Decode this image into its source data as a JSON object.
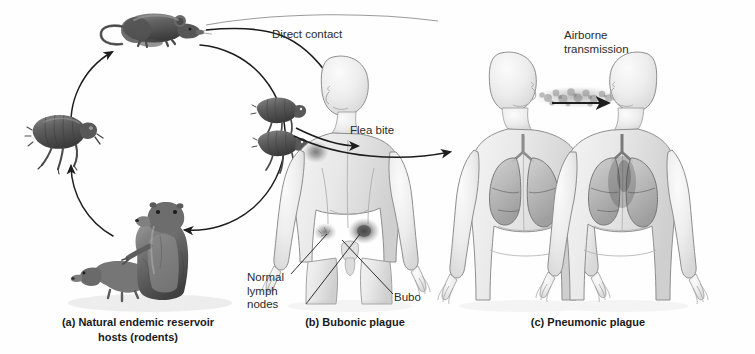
{
  "figure": {
    "background_color": "#fefefe",
    "ink_color": "#242424"
  },
  "path_labels": {
    "direct_contact": "Direct contact",
    "flea_bite": "Flea bite",
    "airborne": "Airborne\ntransmission"
  },
  "callouts": {
    "lymph_nodes": "Normal\nlymph\nnodes",
    "bubo": "Bubo"
  },
  "captions": {
    "a": "(a) Natural endemic reservoir\nhosts (rodents)",
    "b": "(b) Bubonic plague",
    "c": "(c) Pneumonic plague"
  },
  "organisms": {
    "rat": "rat-illustration",
    "flea_vector": "flea-illustration",
    "rodents": "prairie-dog-illustration",
    "fleas_on_human": "fleas-biting-illustration"
  },
  "human_figures": {
    "bubonic": "human-figure-bubonic",
    "pneumonic_source": "human-figure-pneumonic-source",
    "pneumonic_recipient": "human-figure-pneumonic-recipient"
  },
  "anatomy": {
    "lungs": "lungs-illustration",
    "droplet_cloud": "respiratory-droplet-cloud"
  },
  "cycle": {
    "name": "enzootic-transmission-cycle",
    "nodes": [
      "rat",
      "flea",
      "rodents"
    ]
  }
}
